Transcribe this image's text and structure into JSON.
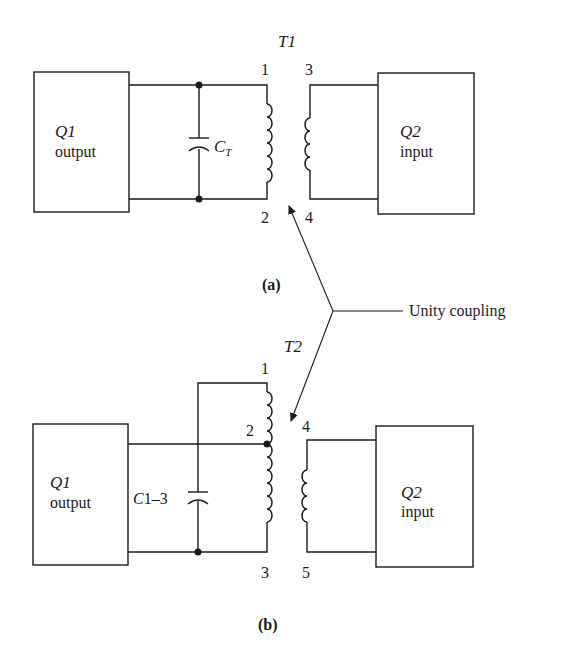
{
  "figure": {
    "callout": "Unity coupling",
    "part_a": {
      "caption": "(a)",
      "transformer": "T1",
      "capacitor": {
        "symbol": "C",
        "subscript": "T"
      },
      "q1_box": {
        "name": "Q1",
        "label": "output"
      },
      "q2_box": {
        "name": "Q2",
        "label": "input"
      },
      "terminals": [
        "1",
        "2",
        "3",
        "4"
      ]
    },
    "part_b": {
      "caption": "(b)",
      "transformer": "T2",
      "capacitor": {
        "label": "C1–3"
      },
      "q1_box": {
        "name": "Q1",
        "label": "output"
      },
      "q2_box": {
        "name": "Q2",
        "label": "input"
      },
      "terminals": [
        "1",
        "2",
        "3",
        "4",
        "5"
      ]
    }
  }
}
